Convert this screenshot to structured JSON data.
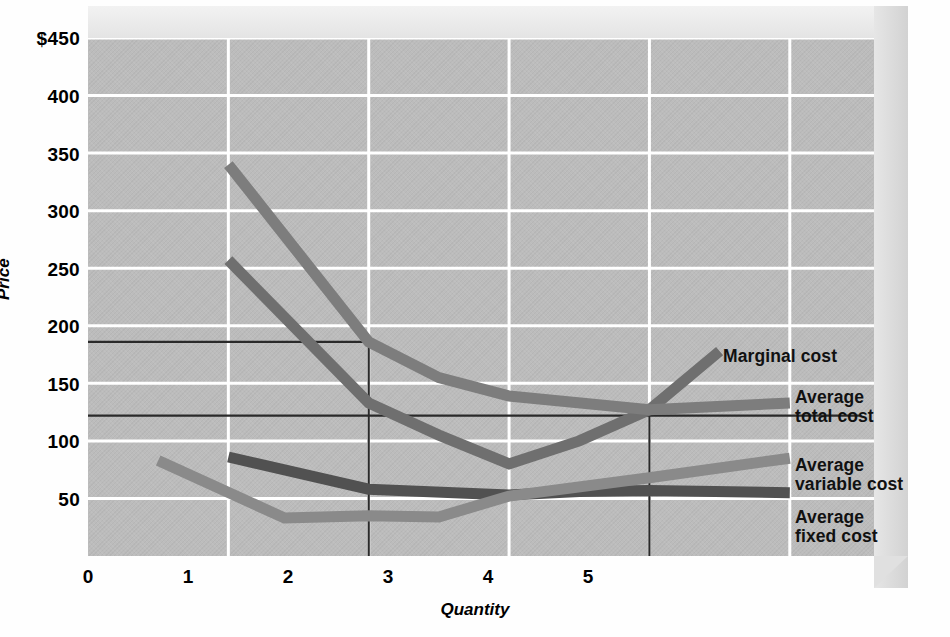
{
  "chart_data": {
    "type": "line",
    "title": "",
    "xlabel": "Quantity",
    "ylabel": "Price",
    "xlim": [
      0,
      5.6
    ],
    "ylim": [
      0,
      450
    ],
    "grid": true,
    "legend_position": "right-inline-labels",
    "x_ticks": [
      "0",
      "1",
      "2",
      "3",
      "4",
      "5"
    ],
    "x_tick_values": [
      0,
      1,
      2,
      3,
      4,
      5
    ],
    "y_ticks": [
      "$450",
      "400",
      "350",
      "300",
      "250",
      "200",
      "150",
      "100",
      "50"
    ],
    "y_tick_values": [
      450,
      400,
      350,
      300,
      250,
      200,
      150,
      100,
      50
    ],
    "series": [
      {
        "name": "Marginal cost",
        "color": "#6f6f6f",
        "x": [
          1.0,
          2.0,
          2.5,
          3.0,
          3.5,
          4.0,
          4.5
        ],
        "values": [
          257,
          133,
          105,
          80,
          100,
          127,
          178
        ]
      },
      {
        "name": "Average total cost",
        "color": "#7d7d7d",
        "x": [
          1.0,
          2.0,
          2.5,
          3.0,
          4.0,
          5.0
        ],
        "values": [
          340,
          186,
          155,
          139,
          127,
          133
        ]
      },
      {
        "name": "Average variable cost",
        "color": "#515151",
        "x": [
          1.0,
          2.0,
          3.0,
          3.5,
          4.0,
          5.0
        ],
        "values": [
          86,
          58,
          53,
          56,
          57,
          55
        ]
      },
      {
        "name": "Average fixed cost",
        "color": "#8a8a8a",
        "x": [
          0.5,
          1.4,
          2.0,
          2.5,
          3.0,
          4.0,
          5.0
        ],
        "values": [
          83,
          33,
          35,
          34,
          52,
          68,
          85
        ]
      }
    ],
    "reference_lines": [
      {
        "name": "price-line-upper",
        "type": "horizontal",
        "y": 186,
        "x_from": 0,
        "x_to": 2
      },
      {
        "name": "price-line-lower",
        "type": "horizontal",
        "y": 122,
        "x_from": 0,
        "x_to": 5.5
      },
      {
        "name": "quantity-line-two",
        "type": "vertical",
        "x": 2,
        "y_from": 0,
        "y_to": 186
      },
      {
        "name": "quantity-line-four",
        "type": "vertical",
        "x": 4,
        "y_from": 0,
        "y_to": 127
      }
    ],
    "annotations": [
      {
        "name": "marginal-cost-label",
        "text": "Marginal cost",
        "x": 4.55,
        "y": 182
      },
      {
        "name": "average-total-cost-label",
        "text": "Average\ntotal cost",
        "x": 5.07,
        "y": 155
      },
      {
        "name": "average-variable-cost-label",
        "text": "Average\nvariable cost",
        "x": 5.07,
        "y": 95
      },
      {
        "name": "average-fixed-cost-label",
        "text": "Average\nfixed cost",
        "x": 5.07,
        "y": 53
      }
    ],
    "colors": {
      "plot_background": "#bcbcbc",
      "gridline": "#ffffff",
      "reference_line": "#2a2a2a",
      "box_top": "#ededed",
      "box_side": "#dcdcdc",
      "text": "#000000"
    }
  }
}
